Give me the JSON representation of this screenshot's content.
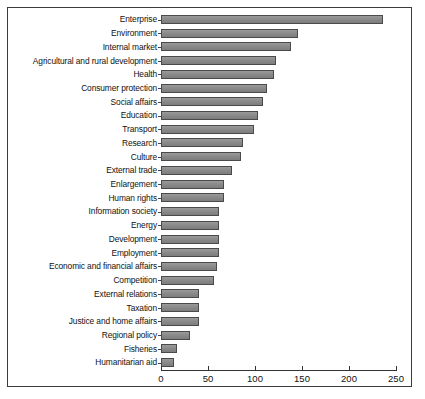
{
  "chart_data": {
    "type": "bar",
    "orientation": "horizontal",
    "title": "",
    "subtitle": "",
    "xlabel": "",
    "ylabel": "",
    "xlim": [
      0,
      250
    ],
    "ylim": null,
    "grid": false,
    "legend": null,
    "xticks": [
      0,
      50,
      100,
      150,
      200,
      250
    ],
    "xtick_labels": [
      "0",
      "50",
      "100",
      "150",
      "200",
      "250"
    ],
    "bar_color": "#8a8a8a",
    "bar_edge_color": "#4a4a4a",
    "background_color": "#ffffff",
    "frame_color": "#3b3b3b",
    "categories": [
      "Enterprise",
      "Environment",
      "Internal market",
      "Agricultural and rural development",
      "Health",
      "Consumer protection",
      "Social affairs",
      "Education",
      "Transport",
      "Research",
      "Culture",
      "External trade",
      "Enlargement",
      "Human rights",
      "Information society",
      "Energy",
      "Development",
      "Employment",
      "Economic and financial affairs",
      "Competition",
      "External relations",
      "Taxation",
      "Justice and home affairs",
      "Regional policy",
      "Fisheries",
      "Humanitarian aid"
    ],
    "values": [
      236,
      146,
      138,
      122,
      120,
      113,
      108,
      103,
      99,
      87,
      85,
      76,
      67,
      67,
      62,
      62,
      62,
      62,
      60,
      56,
      40,
      40,
      40,
      31,
      17,
      14
    ]
  }
}
